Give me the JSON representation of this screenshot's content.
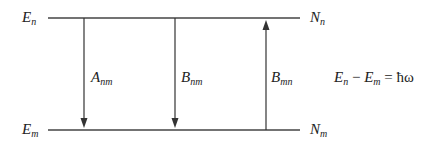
{
  "levels": {
    "upper": {
      "energy_label": "E",
      "energy_sub": "n",
      "pop_label": "N",
      "pop_sub": "n"
    },
    "lower": {
      "energy_label": "E",
      "energy_sub": "m",
      "pop_label": "N",
      "pop_sub": "m"
    }
  },
  "transitions": [
    {
      "label": "A",
      "sub": "nm",
      "direction": "down"
    },
    {
      "label": "B",
      "sub": "nm",
      "direction": "down"
    },
    {
      "label": "B",
      "sub": "mn",
      "direction": "up"
    }
  ],
  "equation": {
    "term1": "E",
    "term1_sub": "n",
    "minus": "−",
    "term2": "E",
    "term2_sub": "m",
    "equals": "=",
    "rhs": "ħω"
  },
  "colors": {
    "line": "#333333"
  }
}
